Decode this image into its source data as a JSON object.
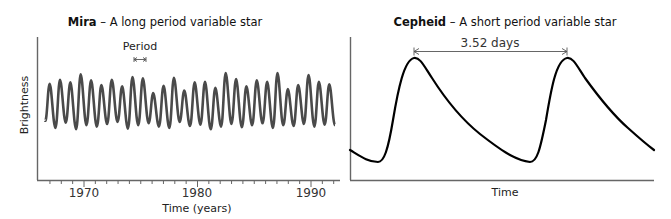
{
  "chart_data": [
    {
      "type": "line",
      "title": "Mira – A long period variable star",
      "title_bold": "Mira",
      "title_rest": " – A long period variable star",
      "xlabel": "Time (years)",
      "ylabel": "Brightness",
      "xticks": [
        "1970",
        "1980",
        "1990"
      ],
      "xlim": [
        1966.5,
        1992.3
      ],
      "minor_ticks": "yearly",
      "annotation": "Period",
      "period_years": 0.91,
      "series": [
        {
          "name": "Mira brightness",
          "note": "Quasi-periodic oscillation ~0.91 yr period, peaks vary in height",
          "peak_heights_relative": [
            0.72,
            0.78,
            0.74,
            0.86,
            0.77,
            0.7,
            0.78,
            0.68,
            0.82,
            0.8,
            0.58,
            0.69,
            0.81,
            0.62,
            0.74,
            0.75,
            0.66,
            0.88,
            0.79,
            0.68,
            0.77,
            0.75,
            0.88,
            0.64,
            0.7,
            0.85,
            0.75,
            0.71
          ]
        }
      ],
      "grid": false
    },
    {
      "type": "line",
      "title": "Cepheid – A short period variable star",
      "title_bold": "Cepheid",
      "title_rest": " – A short period variable star",
      "xlabel": "Time",
      "ylabel": "",
      "annotation": "3.52 days",
      "period_days": 3.52,
      "series": [
        {
          "name": "Cepheid brightness",
          "note": "Sawtooth light curve: rapid rise, slow decline; two peaks shown",
          "peaks_count": 2
        }
      ],
      "grid": false
    }
  ],
  "left": {
    "title_bold": "Mira",
    "title_rest": " – A long period variable star",
    "ylabel": "Brightness",
    "xlabel": "Time (years)",
    "ticks": [
      "1970",
      "1980",
      "1990"
    ],
    "annotation": "Period"
  },
  "right": {
    "title_bold": "Cepheid",
    "title_rest": " – A short period variable star",
    "xlabel": "Time",
    "annotation": "3.52 days"
  }
}
